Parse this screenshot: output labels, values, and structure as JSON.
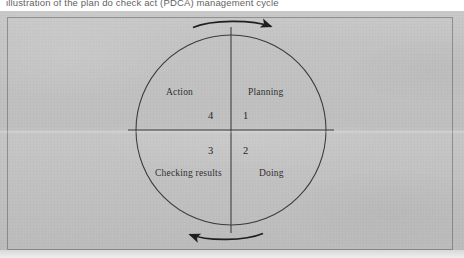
{
  "page": {
    "header_text": "illustration of the plan do check act (PDCA) management cycle"
  },
  "figure": {
    "quadrants": [
      {
        "id": "planning",
        "label": "Planning",
        "number": "1",
        "position": "top-right"
      },
      {
        "id": "doing",
        "label": "Doing",
        "number": "2",
        "position": "bottom-right"
      },
      {
        "id": "checking",
        "label": "Checking results",
        "number": "3",
        "position": "bottom-left"
      },
      {
        "id": "action",
        "label": "Action",
        "number": "4",
        "position": "top-left"
      }
    ],
    "arrows": [
      {
        "id": "top-arrow",
        "direction": "right",
        "position": "above-circle"
      },
      {
        "id": "bottom-arrow",
        "direction": "left",
        "position": "below-circle"
      }
    ],
    "rotation": "clockwise",
    "colors": {
      "ink": "#2a2a2a",
      "line": "#3a3a3a",
      "paper": "#c1c1c1",
      "frame": "#3c3c3c"
    }
  }
}
